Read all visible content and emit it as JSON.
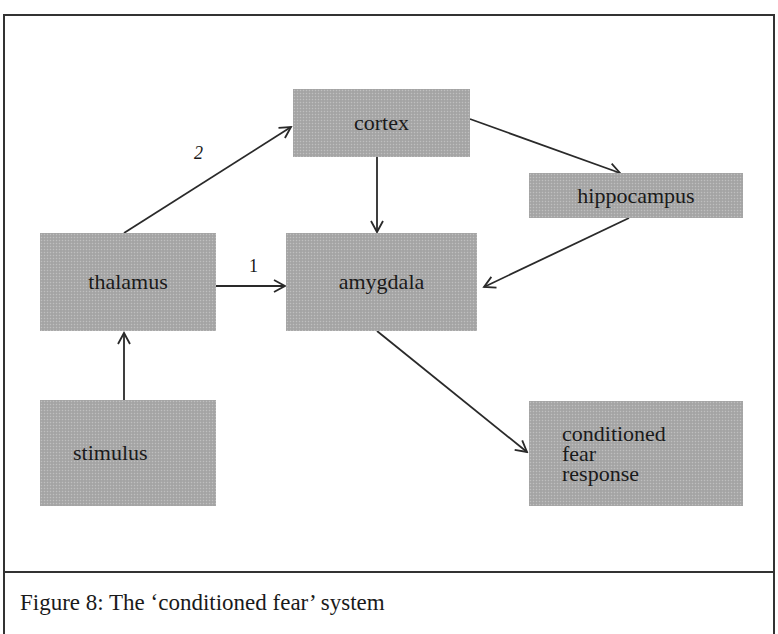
{
  "figure": {
    "caption": "Figure 8: The ‘conditioned fear’ system",
    "colors": {
      "node_fill": "#a9a9a9",
      "line": "#2a2a2a",
      "border": "#333333"
    }
  },
  "nodes": [
    {
      "id": "cortex",
      "label": "cortex"
    },
    {
      "id": "hippocampus",
      "label": "hippocampus"
    },
    {
      "id": "thalamus",
      "label": "thalamus"
    },
    {
      "id": "amygdala",
      "label": "amygdala"
    },
    {
      "id": "stimulus",
      "label": "stimulus"
    },
    {
      "id": "response",
      "label": "conditioned\nfear\nresponse"
    }
  ],
  "edges": [
    {
      "from": "stimulus",
      "to": "thalamus",
      "label": ""
    },
    {
      "from": "thalamus",
      "to": "amygdala",
      "label": "1"
    },
    {
      "from": "thalamus",
      "to": "cortex",
      "label": "2"
    },
    {
      "from": "cortex",
      "to": "amygdala",
      "label": ""
    },
    {
      "from": "cortex",
      "to": "hippocampus",
      "label": ""
    },
    {
      "from": "hippocampus",
      "to": "amygdala",
      "label": ""
    },
    {
      "from": "amygdala",
      "to": "response",
      "label": ""
    }
  ]
}
